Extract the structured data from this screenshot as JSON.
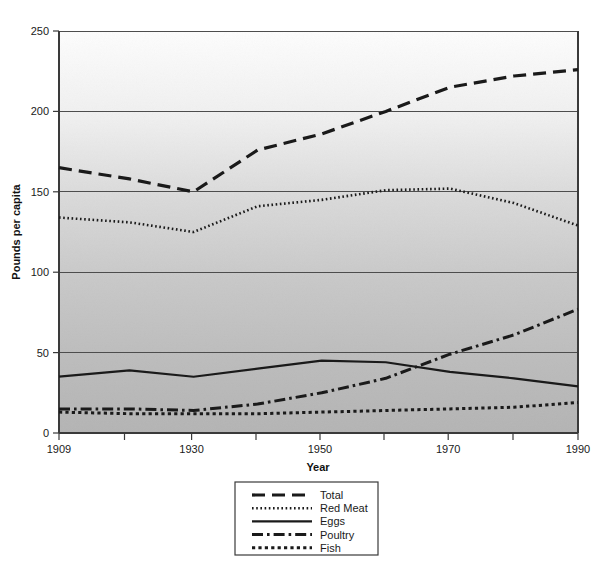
{
  "chart_data": {
    "type": "line",
    "title": "",
    "xlabel": "Year",
    "ylabel": "Pounds per capita",
    "xlim": [
      1909,
      1990
    ],
    "ylim": [
      0,
      250
    ],
    "grid": true,
    "grid_axis": "y",
    "legend_position": "bottom-center",
    "xticks": [
      1909,
      1930,
      1950,
      1970,
      1990
    ],
    "xtick_labels": [
      "1909",
      "1930",
      "1950",
      "1970",
      "1990"
    ],
    "xticks_minor": [
      1919.5,
      1940,
      1960,
      1980
    ],
    "yticks": [
      0,
      50,
      100,
      150,
      200,
      250
    ],
    "ytick_labels": [
      "0",
      "50",
      "100",
      "150",
      "200",
      "250"
    ],
    "x": [
      1909,
      1920,
      1930,
      1940,
      1950,
      1960,
      1970,
      1980,
      1990
    ],
    "series": [
      {
        "name": "Total",
        "style": "dashed",
        "values": [
          165,
          158,
          150,
          176,
          186,
          200,
          215,
          222,
          226
        ]
      },
      {
        "name": "Red Meat",
        "style": "dotted",
        "values": [
          134,
          131,
          125,
          141,
          145,
          151,
          152,
          143,
          129
        ]
      },
      {
        "name": "Eggs",
        "style": "solid",
        "values": [
          35,
          39,
          35,
          40,
          45,
          44,
          38,
          34,
          29
        ]
      },
      {
        "name": "Poultry",
        "style": "dash-dot",
        "values": [
          15,
          15,
          14,
          18,
          25,
          34,
          49,
          61,
          77
        ]
      },
      {
        "name": "Fish",
        "style": "dense-dotted",
        "values": [
          13,
          12,
          12,
          12,
          13,
          14,
          15,
          16,
          19
        ]
      }
    ]
  },
  "axes": {
    "y_title": "Pounds per capita",
    "x_title": "Year",
    "x_tick_labels": [
      "1909",
      "1930",
      "1950",
      "1970",
      "1990"
    ],
    "y_tick_labels": [
      "250",
      "200",
      "150",
      "100",
      "50",
      "0"
    ]
  },
  "legend": {
    "items": [
      {
        "label": "Total",
        "style": "dashed"
      },
      {
        "label": "Red Meat",
        "style": "dotted"
      },
      {
        "label": "Eggs",
        "style": "solid"
      },
      {
        "label": "Poultry",
        "style": "dash-dot"
      },
      {
        "label": "Fish",
        "style": "dense-dotted"
      }
    ]
  },
  "colors": {
    "line": "#1a1a1a",
    "grid": "#555555",
    "axis": "#444444",
    "plot_bg_top": "#fbfbfb",
    "plot_bg_bottom": "#b9b9b9",
    "text": "#1a1a1a"
  }
}
